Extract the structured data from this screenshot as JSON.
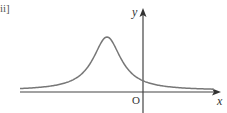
{
  "figure": {
    "part_label": "ii]",
    "x_axis_label": "x",
    "y_axis_label": "y",
    "origin_label": "O",
    "colors": {
      "axis": "#444444",
      "curve": "#777777",
      "text": "#333333"
    },
    "axes_px": {
      "origin_x": 143,
      "origin_y": 92,
      "x_start": 20,
      "x_end": 221,
      "y_top": 8,
      "y_bottom": 113
    },
    "curve": {
      "description": "Single-peaked bell-shaped (Lorentzian-like) curve with maximum to the left of the y-axis, positive y-intercept, approaching the x-axis asymptotically on both sides",
      "peak_px": {
        "x": 107,
        "y": 37
      },
      "y_intercept_px": 82,
      "half_width_px": 17,
      "x_from_px": 20,
      "x_to_px": 214
    }
  }
}
